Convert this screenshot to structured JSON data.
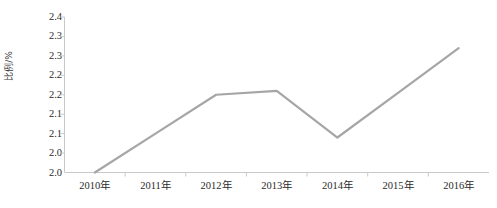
{
  "chart_data": {
    "type": "line",
    "title": "",
    "subtitle": "",
    "xlabel": "",
    "ylabel": "比例/%",
    "categories": [
      "2010年",
      "2011年",
      "2012年",
      "2013年",
      "2014年",
      "2015年",
      "2016年"
    ],
    "values": [
      2.0,
      2.1,
      2.2,
      2.21,
      2.09,
      2.205,
      2.32
    ],
    "series": [
      {
        "name": "比例/%",
        "values": [
          2.0,
          2.1,
          2.2,
          2.21,
          2.09,
          2.205,
          2.32
        ]
      }
    ],
    "ylim": [
      2.0,
      2.4
    ],
    "xlim_categories": 7,
    "y_tick_values": [
      2.4,
      2.35,
      2.3,
      2.25,
      2.2,
      2.15,
      2.1,
      2.05,
      2.0
    ],
    "y_tick_labels": [
      "2.4",
      "2.3",
      "2.3",
      "2.2",
      "2.2",
      "2.1",
      "2.1",
      "2.0"
    ],
    "y_tick_labels_positions": [
      2.4,
      2.35,
      2.3,
      2.25,
      2.2,
      2.15,
      2.1,
      2.05
    ],
    "grid": false,
    "legend": false,
    "legend_position": "none",
    "markers": false,
    "annotations": [],
    "line_color": "#a6a6a6",
    "axis_color": "#c9c9c9",
    "background_color": "#ffffff",
    "text_color": "#2b2b2b"
  }
}
